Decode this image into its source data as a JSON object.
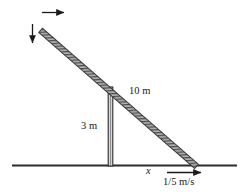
{
  "figure": {
    "type": "physics-related-rates-diagram",
    "width": 248,
    "height": 195,
    "background_color": "#ffffff",
    "stroke_color": "#333333",
    "labels": {
      "ladder_length": "10 m",
      "post_height": "3 m",
      "base_distance": "x",
      "base_velocity": "1/5 m/s"
    },
    "geometry": {
      "ladder": {
        "name": "ladder",
        "top": [
          40,
          31
        ],
        "bottom": [
          196,
          167
        ],
        "thickness": 5,
        "style": "hatched-bar",
        "length_label": "10 m"
      },
      "post": {
        "name": "vertical-post",
        "x": 110,
        "top_y": 87,
        "bottom_y": 166,
        "width": 4,
        "height_label": "3 m"
      },
      "ground": {
        "name": "ground-line",
        "y": 165,
        "x_start": 12,
        "x_end": 237
      }
    },
    "arrows": {
      "top_horizontal": {
        "name": "horizontal-motion-arrow",
        "from": [
          42,
          12
        ],
        "to": [
          68,
          12
        ],
        "direction": "right"
      },
      "left_vertical": {
        "name": "vertical-motion-arrow",
        "from": [
          32,
          24
        ],
        "to": [
          32,
          46
        ],
        "direction": "down"
      },
      "base_velocity": {
        "name": "base-velocity-arrow",
        "from": [
          167,
          172
        ],
        "to": [
          205,
          172
        ],
        "direction": "right",
        "label": "1/5 m/s"
      }
    }
  }
}
